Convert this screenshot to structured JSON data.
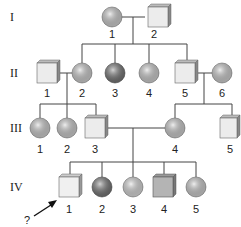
{
  "diagram": {
    "type": "pedigree",
    "generations": [
      "I",
      "II",
      "III",
      "IV"
    ],
    "individuals": {
      "I-1": {
        "label": "1",
        "sex": "female",
        "fill": "#c8c8c8"
      },
      "I-2": {
        "label": "2",
        "sex": "male",
        "fill": "#ececec"
      },
      "II-1": {
        "label": "1",
        "sex": "male",
        "fill": "#ececec"
      },
      "II-2": {
        "label": "2",
        "sex": "female",
        "fill": "#c8c8c8"
      },
      "II-3": {
        "label": "3",
        "sex": "female",
        "fill": "#6e6e6e"
      },
      "II-4": {
        "label": "4",
        "sex": "female",
        "fill": "#c8c8c8"
      },
      "II-5": {
        "label": "5",
        "sex": "male",
        "fill": "#ececec"
      },
      "II-6": {
        "label": "6",
        "sex": "female",
        "fill": "#c8c8c8"
      },
      "III-1": {
        "label": "1",
        "sex": "female",
        "fill": "#c8c8c8"
      },
      "III-2": {
        "label": "2",
        "sex": "female",
        "fill": "#c8c8c8"
      },
      "III-3": {
        "label": "3",
        "sex": "male",
        "fill": "#ececec"
      },
      "III-4": {
        "label": "4",
        "sex": "female",
        "fill": "#c8c8c8"
      },
      "III-5": {
        "label": "5",
        "sex": "male",
        "fill": "#ececec"
      },
      "IV-1": {
        "label": "1",
        "sex": "male",
        "fill": "#f0f0f0"
      },
      "IV-2": {
        "label": "2",
        "sex": "female",
        "fill": "#6e6e6e"
      },
      "IV-3": {
        "label": "3",
        "sex": "female",
        "fill": "#d4d4d4"
      },
      "IV-4": {
        "label": "4",
        "sex": "male",
        "fill": "#b4b4b4"
      },
      "IV-5": {
        "label": "5",
        "sex": "female",
        "fill": "#c8c8c8"
      }
    },
    "proband": {
      "target": "IV-1",
      "marker": "?"
    }
  }
}
